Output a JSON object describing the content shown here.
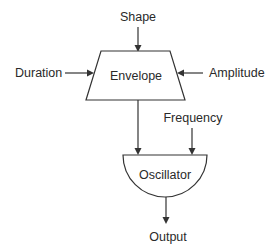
{
  "diagram": {
    "nodes": {
      "envelope": {
        "label": "Envelope",
        "shape": "trapezoid"
      },
      "oscillator": {
        "label": "Oscillator",
        "shape": "half-circle"
      }
    },
    "inputs": {
      "shape": "Shape",
      "duration": "Duration",
      "amplitude": "Amplitude",
      "frequency": "Frequency"
    },
    "output": "Output",
    "edges": [
      {
        "from": "Shape",
        "to": "Envelope"
      },
      {
        "from": "Duration",
        "to": "Envelope"
      },
      {
        "from": "Amplitude",
        "to": "Envelope"
      },
      {
        "from": "Envelope",
        "to": "Oscillator"
      },
      {
        "from": "Frequency",
        "to": "Oscillator"
      },
      {
        "from": "Oscillator",
        "to": "Output"
      }
    ],
    "colors": {
      "stroke": "#333333",
      "text": "#2a2a2a",
      "background": "#ffffff"
    }
  }
}
